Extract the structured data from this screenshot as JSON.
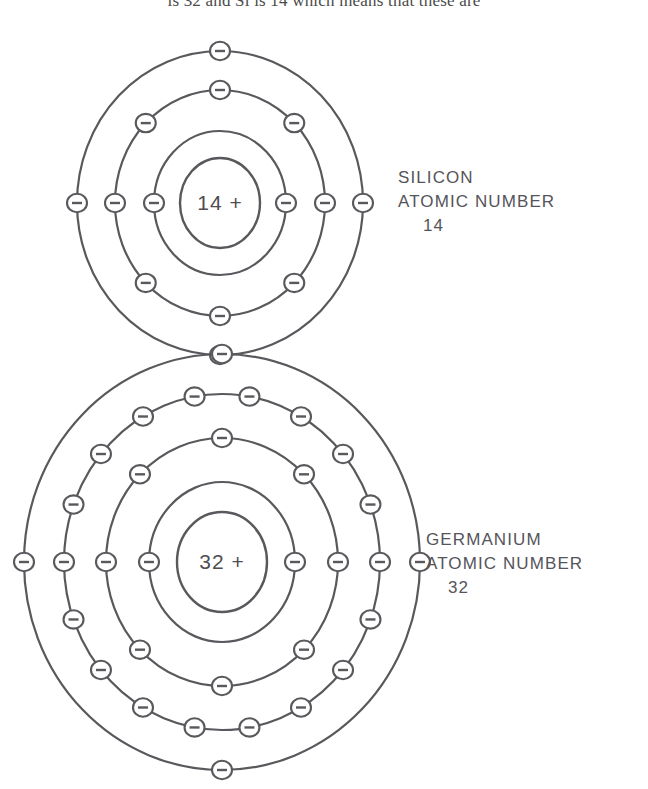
{
  "page": {
    "background_color": "#ffffff",
    "ink_color": "#5a585c",
    "text_color": "#55545a",
    "truncated_body_text": "is 32 and Si is 14 which means that these are"
  },
  "diagram": {
    "title_hidden": true,
    "type": "bohr-atomic-shell-diagram",
    "atoms": [
      {
        "id": "silicon",
        "element_name": "SILICON",
        "label_line_2": "ATOMIC NUMBER",
        "atomic_number": "14",
        "nucleus_text": "14 +",
        "charge_symbol": "+",
        "center": {
          "x": 220,
          "y": 203
        },
        "nucleus_radius_x": 40,
        "nucleus_radius_y": 45,
        "electron_glyph": "minus",
        "shells": [
          {
            "index": 1,
            "radius_x": 66,
            "radius_y": 72,
            "electron_count": 2,
            "start_angle": 0
          },
          {
            "index": 2,
            "radius_x": 105,
            "radius_y": 113,
            "electron_count": 8,
            "start_angle": 0
          },
          {
            "index": 3,
            "radius_x": 143,
            "radius_y": 152,
            "electron_count": 4,
            "start_angle": 0
          }
        ],
        "shell_occupancy": [
          2,
          8,
          4
        ],
        "total_electrons": 14,
        "valence_electrons": 4
      },
      {
        "id": "germanium",
        "element_name": "GERMANIUM",
        "label_line_2": "ATOMIC NUMBER",
        "atomic_number": "32",
        "nucleus_text": "32 +",
        "charge_symbol": "+",
        "center": {
          "x": 222,
          "y": 562
        },
        "nucleus_radius_x": 45,
        "nucleus_radius_y": 50,
        "electron_glyph": "minus",
        "shells": [
          {
            "index": 1,
            "radius_x": 73,
            "radius_y": 80,
            "electron_count": 2,
            "start_angle": 0
          },
          {
            "index": 2,
            "radius_x": 116,
            "radius_y": 124,
            "electron_count": 8,
            "start_angle": 0
          },
          {
            "index": 3,
            "radius_x": 158,
            "radius_y": 168,
            "electron_count": 18,
            "start_angle": 0
          },
          {
            "index": 4,
            "radius_x": 198,
            "radius_y": 208,
            "electron_count": 4,
            "start_angle": 0
          }
        ],
        "shell_occupancy": [
          2,
          8,
          18,
          4
        ],
        "total_electrons": 32,
        "valence_electrons": 4
      }
    ]
  }
}
